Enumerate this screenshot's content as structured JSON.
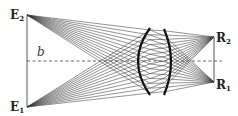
{
  "diagram": {
    "type": "optical-ray-diagram",
    "labels": {
      "E2": {
        "main": "E",
        "sub": "2"
      },
      "E1": {
        "main": "E",
        "sub": "1"
      },
      "R2": {
        "main": "R",
        "sub": "2"
      },
      "R1": {
        "main": "R",
        "sub": "1"
      },
      "b": "b"
    },
    "points": {
      "E2": [
        27,
        15
      ],
      "E1": [
        27,
        107
      ],
      "R2": [
        214,
        37
      ],
      "R1": [
        214,
        82
      ]
    },
    "axis_y": 61,
    "lens": {
      "top": [
        150,
        28
      ],
      "bottom": [
        150,
        95
      ],
      "left_bulge_x": 136,
      "right_bulge_x": 170,
      "right_top": [
        164,
        29
      ],
      "right_bottom": [
        164,
        95
      ]
    },
    "ray_count_per_source": 14,
    "colors": {
      "rays": "#3a3a3a",
      "lens": "#111111",
      "axis": "#555555",
      "background": "#ffffff"
    }
  }
}
